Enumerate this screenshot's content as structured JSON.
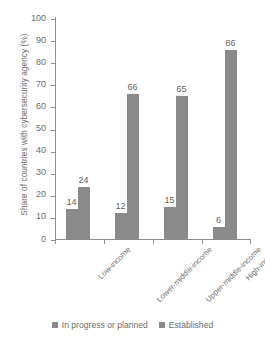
{
  "chart_data": {
    "type": "bar",
    "title": "",
    "subtitle": "",
    "xlabel": "",
    "ylabel": "Share of countries with cybersecurity agency (%)",
    "categories": [
      "Low-income",
      "Lower-middle-income",
      "Upper-middle-income",
      "High-income"
    ],
    "series": [
      {
        "name": "In progress or planned",
        "values": [
          14,
          12,
          15,
          6
        ],
        "color": "#8a8a8a"
      },
      {
        "name": "Established",
        "values": [
          24,
          66,
          65,
          86
        ],
        "color": "#8a8a8a"
      }
    ],
    "ylim": [
      0,
      100
    ],
    "yticks": [
      0,
      10,
      20,
      30,
      40,
      50,
      60,
      70,
      80,
      90,
      100
    ],
    "ytick_labels": [
      "0",
      "10",
      "20",
      "30",
      "40",
      "50",
      "60",
      "70",
      "80",
      "90",
      "100"
    ],
    "grid": false,
    "legend_position": "bottom",
    "data_labels": true
  },
  "legend": {
    "items": [
      {
        "label": "In progress or planned"
      },
      {
        "label": "Established"
      }
    ]
  }
}
